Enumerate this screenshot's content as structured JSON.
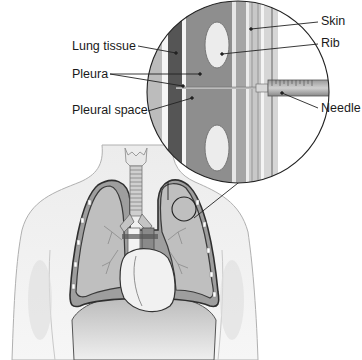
{
  "diagram": {
    "type": "anatomical illustration - thoracentesis (pleural needle insertion)",
    "labels": {
      "lung_tissue": "Lung tissue",
      "pleura": "Pleura",
      "pleural_space": "Pleural space",
      "skin": "Skin",
      "rib": "Rib",
      "needle": "Needle"
    },
    "colors": {
      "background": "#ffffff",
      "body": "#e6e6e6",
      "body_outline": "#a8a8a8",
      "lung": "#bdbdbd",
      "lung_outline": "#3a3a3a",
      "heart": "#f0f0f0",
      "muscle": "#8c8c8c",
      "rib": "#eeeeee",
      "line": "#222222"
    }
  }
}
